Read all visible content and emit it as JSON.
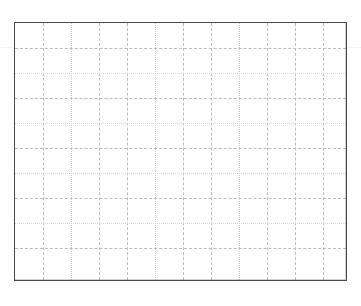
{
  "chart_data": {
    "type": "line",
    "title": "",
    "subtitle": "",
    "xlabel": "",
    "ylabel": "",
    "categories": [],
    "values": [],
    "series": [],
    "annotations": [],
    "legend": {
      "entries": [],
      "position": "none",
      "visible": false
    },
    "axes": {
      "x": {
        "ticks": [],
        "tick_labels": [],
        "visible_labels": false,
        "xlim": [
          0,
          12
        ]
      },
      "y": {
        "ticks": [],
        "tick_labels": [],
        "visible_labels": false,
        "ylim": [
          0,
          10
        ]
      }
    },
    "grid": {
      "visible": true,
      "style": "dashed",
      "color": "#bdbdbd",
      "x_divisions": 12,
      "y_divisions": 10
    },
    "frame": {
      "visible": true,
      "color": "#4a4a4a",
      "background": "#ffffff"
    },
    "note": "Empty plot area: gridlines and frame only, no plotted data or text"
  },
  "plot": {
    "background_color": "#ffffff",
    "frame_color": "#4a4a4a",
    "grid_color": "#bdbdbd",
    "grid_faint_color": "#d6d6d6",
    "vertical_lines": [
      28,
      56,
      84,
      112,
      140,
      168,
      196,
      224,
      252,
      280,
      308
    ],
    "vertical_faint": [
      56,
      140,
      224
    ],
    "horizontal_lines": [
      25,
      50,
      75,
      100,
      125,
      150,
      175,
      200,
      225
    ],
    "horizontal_faint": [
      50,
      100,
      150,
      200
    ],
    "bleed_lines": [
      47
    ]
  }
}
